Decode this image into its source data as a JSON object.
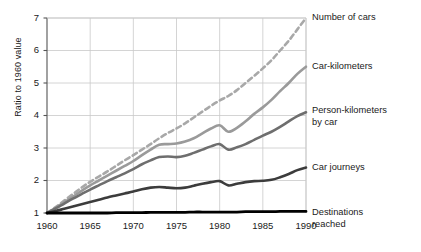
{
  "chart_data": {
    "type": "line",
    "title": "",
    "xlabel": "",
    "ylabel": "Ratio to 1960 value",
    "xlim": [
      1960,
      1990
    ],
    "ylim": [
      1,
      7
    ],
    "grid": true,
    "legend_position": "right-inline",
    "x_ticks": [
      "1960",
      "1965",
      "1970",
      "1975",
      "1980",
      "1985",
      "1990"
    ],
    "y_ticks": [
      "1",
      "2",
      "3",
      "4",
      "5",
      "6",
      "7"
    ],
    "x": [
      1960,
      1961,
      1962,
      1963,
      1964,
      1965,
      1966,
      1967,
      1968,
      1969,
      1970,
      1971,
      1972,
      1973,
      1974,
      1975,
      1976,
      1977,
      1978,
      1979,
      1980,
      1981,
      1982,
      1983,
      1984,
      1985,
      1986,
      1987,
      1988,
      1989,
      1990
    ],
    "series": [
      {
        "name": "Number of cars",
        "style": "dashed",
        "color": "#a8a8a8",
        "width": 2.6,
        "values": [
          1.0,
          1.18,
          1.38,
          1.58,
          1.78,
          1.96,
          2.12,
          2.28,
          2.45,
          2.62,
          2.78,
          2.95,
          3.12,
          3.3,
          3.46,
          3.6,
          3.76,
          3.94,
          4.12,
          4.3,
          4.46,
          4.6,
          4.78,
          5.0,
          5.22,
          5.45,
          5.7,
          6.0,
          6.3,
          6.65,
          7.0
        ]
      },
      {
        "name": "Car-kilometers",
        "style": "solid",
        "color": "#9a9a9a",
        "width": 2.6,
        "values": [
          1.0,
          1.16,
          1.33,
          1.5,
          1.68,
          1.85,
          2.0,
          2.15,
          2.3,
          2.45,
          2.6,
          2.78,
          2.95,
          3.1,
          3.12,
          3.14,
          3.2,
          3.3,
          3.45,
          3.6,
          3.7,
          3.5,
          3.62,
          3.82,
          4.05,
          4.25,
          4.48,
          4.75,
          5.0,
          5.28,
          5.5
        ]
      },
      {
        "name": "Person-kilometers\nby car",
        "style": "solid",
        "color": "#6e6e6e",
        "width": 2.6,
        "values": [
          1.0,
          1.14,
          1.29,
          1.44,
          1.58,
          1.72,
          1.85,
          1.98,
          2.1,
          2.22,
          2.35,
          2.5,
          2.62,
          2.72,
          2.74,
          2.72,
          2.76,
          2.85,
          2.95,
          3.05,
          3.12,
          2.95,
          3.02,
          3.12,
          3.25,
          3.38,
          3.5,
          3.65,
          3.82,
          3.98,
          4.1
        ]
      },
      {
        "name": "Car journeys",
        "style": "solid",
        "color": "#3c3c3c",
        "width": 2.6,
        "values": [
          1.0,
          1.06,
          1.13,
          1.2,
          1.27,
          1.34,
          1.41,
          1.48,
          1.54,
          1.6,
          1.66,
          1.73,
          1.78,
          1.8,
          1.78,
          1.76,
          1.78,
          1.84,
          1.9,
          1.95,
          1.98,
          1.85,
          1.9,
          1.95,
          1.98,
          1.99,
          2.02,
          2.1,
          2.2,
          2.32,
          2.4
        ]
      },
      {
        "name": "Destinations\nreached",
        "style": "solid",
        "color": "#000000",
        "width": 2.8,
        "values": [
          1.0,
          1.0,
          1.0,
          1.0,
          1.0,
          1.0,
          1.0,
          1.0,
          1.01,
          1.01,
          1.01,
          1.01,
          1.02,
          1.02,
          1.02,
          1.02,
          1.02,
          1.03,
          1.03,
          1.03,
          1.03,
          1.03,
          1.03,
          1.04,
          1.04,
          1.04,
          1.04,
          1.05,
          1.05,
          1.05,
          1.05
        ]
      }
    ]
  },
  "labels": {
    "number_of_cars": "Number of cars",
    "car_kilometers": "Car-kilometers",
    "person_kilometers": "Person-kilometers\nby car",
    "car_journeys": "Car journeys",
    "destinations_reached": "Destinations\nreached"
  },
  "axis": {
    "y_title": "Ratio to 1960 value"
  },
  "style": {
    "grid_color": "#c9c9c9",
    "axis_color": "#555555",
    "background": "#ffffff"
  }
}
